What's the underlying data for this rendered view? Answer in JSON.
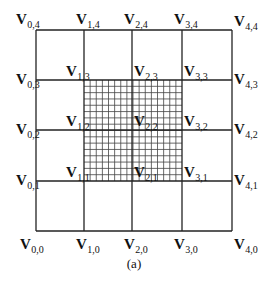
{
  "figure": {
    "caption": "(a)",
    "line_color": "#222222",
    "fine_line_color": "#444444",
    "coarse_grid": {
      "x": [
        36,
        84,
        132,
        182,
        232
      ],
      "y": [
        30,
        80,
        130,
        181,
        231
      ]
    },
    "refined_region": {
      "x0": 84,
      "y0": 80,
      "x1": 182,
      "y1": 181,
      "subdivisions": 16
    },
    "vertices": [
      {
        "i": 0,
        "j": 4,
        "base": "V",
        "sub": "0,4",
        "x": 16,
        "y": 24
      },
      {
        "i": 1,
        "j": 4,
        "base": "V",
        "sub": "1,4",
        "x": 76,
        "y": 24
      },
      {
        "i": 2,
        "j": 4,
        "base": "V",
        "sub": "2,4",
        "x": 124,
        "y": 24
      },
      {
        "i": 3,
        "j": 4,
        "base": "V",
        "sub": "3,4",
        "x": 174,
        "y": 24
      },
      {
        "i": 4,
        "j": 4,
        "base": "V",
        "sub": "4,4",
        "x": 234,
        "y": 26
      },
      {
        "i": 0,
        "j": 3,
        "base": "V",
        "sub": "0,3",
        "x": 16,
        "y": 84
      },
      {
        "i": 1,
        "j": 3,
        "base": "V",
        "sub": "1,3",
        "x": 66,
        "y": 76
      },
      {
        "i": 2,
        "j": 3,
        "base": "V",
        "sub": "2,3",
        "x": 134,
        "y": 76
      },
      {
        "i": 3,
        "j": 3,
        "base": "V",
        "sub": "3,3",
        "x": 184,
        "y": 76
      },
      {
        "i": 4,
        "j": 3,
        "base": "V",
        "sub": "4,3",
        "x": 234,
        "y": 84
      },
      {
        "i": 0,
        "j": 2,
        "base": "V",
        "sub": "0,2",
        "x": 16,
        "y": 134
      },
      {
        "i": 1,
        "j": 2,
        "base": "V",
        "sub": "1,2",
        "x": 66,
        "y": 126
      },
      {
        "i": 2,
        "j": 2,
        "base": "V",
        "sub": "2,2",
        "x": 134,
        "y": 126
      },
      {
        "i": 3,
        "j": 2,
        "base": "V",
        "sub": "3,2",
        "x": 184,
        "y": 126
      },
      {
        "i": 4,
        "j": 2,
        "base": "V",
        "sub": "4,2",
        "x": 234,
        "y": 134
      },
      {
        "i": 0,
        "j": 1,
        "base": "V",
        "sub": "0,1",
        "x": 16,
        "y": 185
      },
      {
        "i": 1,
        "j": 1,
        "base": "V",
        "sub": "1,1",
        "x": 66,
        "y": 177
      },
      {
        "i": 2,
        "j": 1,
        "base": "V",
        "sub": "2,1",
        "x": 134,
        "y": 177
      },
      {
        "i": 3,
        "j": 1,
        "base": "V",
        "sub": "3,1",
        "x": 184,
        "y": 177
      },
      {
        "i": 4,
        "j": 1,
        "base": "V",
        "sub": "4,1",
        "x": 234,
        "y": 185
      },
      {
        "i": 0,
        "j": 0,
        "base": "V",
        "sub": "0,0",
        "x": 20,
        "y": 249
      },
      {
        "i": 1,
        "j": 0,
        "base": "V",
        "sub": "1,0",
        "x": 76,
        "y": 249
      },
      {
        "i": 2,
        "j": 0,
        "base": "V",
        "sub": "2,0",
        "x": 124,
        "y": 249
      },
      {
        "i": 3,
        "j": 0,
        "base": "V",
        "sub": "3,0",
        "x": 174,
        "y": 249
      },
      {
        "i": 4,
        "j": 0,
        "base": "V",
        "sub": "4,0",
        "x": 234,
        "y": 249
      }
    ]
  }
}
